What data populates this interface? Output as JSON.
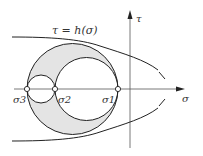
{
  "diagram": {
    "curve_label": "τ = h(σ)",
    "axis_x_label": "σ",
    "axis_y_label": "τ",
    "points": [
      {
        "label": "σ3",
        "sub": "3",
        "x": 27
      },
      {
        "label": "σ2",
        "sub": "2",
        "x": 55
      },
      {
        "label": "σ1",
        "sub": "1",
        "x": 118
      }
    ],
    "colors": {
      "line": "#222222",
      "fill": "#e4e4e4",
      "axis": "#333333"
    }
  }
}
